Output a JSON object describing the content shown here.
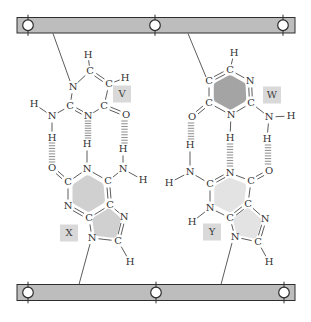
{
  "figure": {
    "width": 311,
    "height": 322,
    "description_label": ""
  },
  "colors": {
    "background": "#ffffff",
    "strand_fill": "#bdbdbd",
    "strand_stroke": "#2e2e2e",
    "bead_fill": "#ffffff",
    "bead_stroke": "#2e2e2e",
    "bond": "#4a4a4a",
    "atom_text": "#333333",
    "hbond": "#979797",
    "label_box_fill": "#d9d9d9",
    "label_text": "#3d3d3d"
  },
  "strands": {
    "top": {
      "x": 17,
      "y": 17.5,
      "w": 278,
      "h": 15.5,
      "beads": [
        28,
        155,
        283
      ]
    },
    "bottom": {
      "x": 17,
      "y": 284.5,
      "w": 278,
      "h": 16,
      "beads": [
        28,
        156,
        284
      ]
    }
  },
  "connectors": [
    [
      53,
      33.5,
      70,
      81
    ],
    [
      188,
      33.5,
      206,
      77
    ],
    [
      90,
      244,
      79,
      284.5
    ],
    [
      232,
      243,
      221,
      284.5
    ]
  ],
  "hydrogen_bonds": [
    {
      "x": 52,
      "y1": 143,
      "y2": 162
    },
    {
      "x": 88,
      "y1": 121,
      "y2": 138
    },
    {
      "x": 124.5,
      "y1": 121,
      "y2": 143
    },
    {
      "x": 191,
      "y1": 123,
      "y2": 139
    },
    {
      "x": 230,
      "y1": 144,
      "y2": 166
    },
    {
      "x": 268,
      "y1": 145,
      "y2": 164
    }
  ],
  "bases": [
    {
      "id": "V",
      "label": "V",
      "box": {
        "cx": 122,
        "cy": 94,
        "w": 18,
        "h": 17
      },
      "fill": null,
      "atoms": {
        "N1": {
          "el": "N",
          "x": 73,
          "y": 87
        },
        "C6": {
          "el": "C",
          "x": 90,
          "y": 71
        },
        "H6": {
          "el": "H",
          "x": 88,
          "y": 55
        },
        "C5": {
          "el": "C",
          "x": 109,
          "y": 84
        },
        "H5": {
          "el": "H",
          "x": 125,
          "y": 78
        },
        "C4": {
          "el": "C",
          "x": 104,
          "y": 106
        },
        "O4": {
          "el": "O",
          "x": 126,
          "y": 115
        },
        "N3": {
          "el": "N",
          "x": 88,
          "y": 116
        },
        "C2": {
          "el": "C",
          "x": 70,
          "y": 106
        },
        "Na": {
          "el": "N",
          "x": 52,
          "y": 116
        },
        "Ha1": {
          "el": "H",
          "x": 34,
          "y": 104
        },
        "Ha2": {
          "el": "H",
          "x": 52,
          "y": 138
        }
      },
      "bonds": [
        [
          "N1",
          "C6",
          1
        ],
        [
          "C6",
          "C5",
          2
        ],
        [
          "C5",
          "C4",
          1
        ],
        [
          "C4",
          "N3",
          1
        ],
        [
          "N3",
          "C2",
          2
        ],
        [
          "C2",
          "N1",
          1
        ],
        [
          "C4",
          "O4",
          2
        ],
        [
          "C6",
          "H6",
          1
        ],
        [
          "C5",
          "H5",
          1
        ],
        [
          "C2",
          "Na",
          1
        ],
        [
          "Na",
          "Ha1",
          1
        ],
        [
          "Na",
          "Ha2",
          1
        ]
      ],
      "rings": []
    },
    {
      "id": "W",
      "label": "W",
      "box": {
        "cx": 272,
        "cy": 95,
        "w": 18,
        "h": 17
      },
      "fill": "#a4a4a4",
      "atoms": {
        "Ca": {
          "el": "C",
          "x": 209,
          "y": 81
        },
        "Cb": {
          "el": "C",
          "x": 230,
          "y": 70
        },
        "Hb": {
          "el": "H",
          "x": 234,
          "y": 53
        },
        "Nc": {
          "el": "N",
          "x": 250,
          "y": 81
        },
        "Cd": {
          "el": "C",
          "x": 251,
          "y": 103
        },
        "Na": {
          "el": "N",
          "x": 269,
          "y": 117
        },
        "HaR": {
          "el": "H",
          "x": 291,
          "y": 116
        },
        "HaD": {
          "el": "H",
          "x": 267,
          "y": 139
        },
        "Ne": {
          "el": "N",
          "x": 231,
          "y": 115
        },
        "He": {
          "el": "H",
          "x": 230,
          "y": 138
        },
        "Cf": {
          "el": "C",
          "x": 209,
          "y": 103
        },
        "O": {
          "el": "O",
          "x": 192,
          "y": 117
        }
      },
      "bonds": [
        [
          "Ca",
          "Cb",
          2
        ],
        [
          "Cb",
          "Nc",
          1
        ],
        [
          "Nc",
          "Cd",
          2
        ],
        [
          "Cd",
          "Ne",
          1
        ],
        [
          "Ne",
          "Cf",
          1
        ],
        [
          "Cf",
          "Ca",
          1
        ],
        [
          "Cf",
          "O",
          2
        ],
        [
          "Cb",
          "Hb",
          1
        ],
        [
          "Ne",
          "He",
          1
        ],
        [
          "Cd",
          "Na",
          1
        ],
        [
          "Na",
          "HaR",
          1
        ],
        [
          "Na",
          "HaD",
          1
        ]
      ],
      "rings": [
        [
          "Ca",
          "Cb",
          "Nc",
          "Cd",
          "Ne",
          "Cf"
        ]
      ]
    },
    {
      "id": "X",
      "label": "X",
      "box": {
        "cx": 69,
        "cy": 233,
        "w": 18,
        "h": 17
      },
      "fill": "#d0d0d0",
      "atoms": {
        "O2": {
          "el": "O",
          "x": 52,
          "y": 168
        },
        "C2": {
          "el": "C",
          "x": 68,
          "y": 182
        },
        "N1": {
          "el": "N",
          "x": 87,
          "y": 169
        },
        "H1": {
          "el": "H",
          "x": 87,
          "y": 144
        },
        "C6": {
          "el": "C",
          "x": 108,
          "y": 181
        },
        "Na": {
          "el": "N",
          "x": 123,
          "y": 169
        },
        "HaU": {
          "el": "H",
          "x": 123,
          "y": 149
        },
        "HaR": {
          "el": "H",
          "x": 143,
          "y": 180
        },
        "N3": {
          "el": "N",
          "x": 68,
          "y": 206
        },
        "C4": {
          "el": "C",
          "x": 89,
          "y": 218
        },
        "C5": {
          "el": "C",
          "x": 110,
          "y": 205
        },
        "N7": {
          "el": "N",
          "x": 124,
          "y": 217
        },
        "C8": {
          "el": "C",
          "x": 118,
          "y": 241
        },
        "H8": {
          "el": "H",
          "x": 130,
          "y": 262
        },
        "N9": {
          "el": "N",
          "x": 92,
          "y": 238
        }
      },
      "bonds": [
        [
          "C2",
          "O2",
          2
        ],
        [
          "C2",
          "N1",
          1
        ],
        [
          "N1",
          "C6",
          1
        ],
        [
          "C6",
          "C5",
          2
        ],
        [
          "C5",
          "C4",
          1
        ],
        [
          "C4",
          "N3",
          2
        ],
        [
          "N3",
          "C2",
          1
        ],
        [
          "N1",
          "H1",
          1
        ],
        [
          "C6",
          "Na",
          1
        ],
        [
          "Na",
          "HaU",
          1
        ],
        [
          "Na",
          "HaR",
          1
        ],
        [
          "C5",
          "N7",
          1
        ],
        [
          "N7",
          "C8",
          2
        ],
        [
          "C8",
          "N9",
          1
        ],
        [
          "N9",
          "C4",
          1
        ],
        [
          "C8",
          "H8",
          1
        ]
      ],
      "rings": [
        [
          "N1",
          "C2",
          "N3",
          "C4",
          "C5",
          "C6"
        ],
        [
          "C4",
          "N9",
          "C8",
          "N7",
          "C5"
        ]
      ]
    },
    {
      "id": "Y",
      "label": "Y",
      "box": {
        "cx": 212,
        "cy": 232,
        "w": 18,
        "h": 17
      },
      "fill": "#e3e3e3",
      "atoms": {
        "Na": {
          "el": "N",
          "x": 190,
          "y": 172
        },
        "HaU": {
          "el": "H",
          "x": 190,
          "y": 145
        },
        "HaL": {
          "el": "H",
          "x": 169,
          "y": 183
        },
        "C2": {
          "el": "C",
          "x": 210,
          "y": 184
        },
        "N1": {
          "el": "N",
          "x": 230,
          "y": 173
        },
        "C6": {
          "el": "C",
          "x": 251,
          "y": 181
        },
        "O6": {
          "el": "O",
          "x": 269,
          "y": 171
        },
        "C5": {
          "el": "C",
          "x": 248,
          "y": 204
        },
        "C4": {
          "el": "C",
          "x": 230,
          "y": 218
        },
        "N3": {
          "el": "N",
          "x": 210,
          "y": 208
        },
        "H3": {
          "el": "H",
          "x": 192,
          "y": 222
        },
        "N7": {
          "el": "N",
          "x": 265,
          "y": 219
        },
        "C8": {
          "el": "C",
          "x": 258,
          "y": 242
        },
        "H8": {
          "el": "H",
          "x": 269,
          "y": 262
        },
        "N9": {
          "el": "N",
          "x": 235,
          "y": 237
        }
      },
      "bonds": [
        [
          "C2",
          "N1",
          2
        ],
        [
          "N1",
          "C6",
          1
        ],
        [
          "C6",
          "O6",
          2
        ],
        [
          "C6",
          "C5",
          1
        ],
        [
          "C5",
          "C4",
          2
        ],
        [
          "C4",
          "N3",
          1
        ],
        [
          "N3",
          "C2",
          1
        ],
        [
          "N3",
          "H3",
          1
        ],
        [
          "C2",
          "Na",
          1
        ],
        [
          "Na",
          "HaU",
          1
        ],
        [
          "Na",
          "HaL",
          1
        ],
        [
          "C5",
          "N7",
          1
        ],
        [
          "N7",
          "C8",
          2
        ],
        [
          "C8",
          "N9",
          1
        ],
        [
          "N9",
          "C4",
          1
        ],
        [
          "C8",
          "H8",
          1
        ]
      ],
      "rings": [
        [
          "N1",
          "C2",
          "N3",
          "C4",
          "C5",
          "C6"
        ],
        [
          "C4",
          "N9",
          "C8",
          "N7",
          "C5"
        ]
      ]
    }
  ]
}
